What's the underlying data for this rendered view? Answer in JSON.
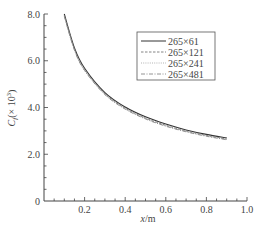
{
  "chart_data": {
    "type": "line",
    "title": "",
    "xlabel": "x/m",
    "ylabel": "Cf(×10³)",
    "ylabel_parts": {
      "main": "C",
      "sub": "f",
      "paren": "(× 10",
      "sup": "3",
      "close": ")"
    },
    "xlabel_parts": {
      "var": "x",
      "unit": "/m"
    },
    "xlim": [
      0,
      1.0
    ],
    "ylim": [
      0,
      8.0
    ],
    "x_ticks": [
      "0.2",
      "0.4",
      "0.6",
      "0.8",
      "1.0"
    ],
    "x_tick_values": [
      0.2,
      0.4,
      0.6,
      0.8,
      1.0
    ],
    "y_ticks": [
      "0",
      "2.0",
      "4.0",
      "6.0",
      "8.0"
    ],
    "y_tick_values": [
      0,
      2.0,
      4.0,
      6.0,
      8.0
    ],
    "grid": false,
    "legend_position": "upper right",
    "x": [
      0.1,
      0.15,
      0.2,
      0.3,
      0.4,
      0.5,
      0.6,
      0.7,
      0.8,
      0.9
    ],
    "series": [
      {
        "name": "265×61",
        "style": "solid",
        "color": "#333333",
        "values": [
          8.0,
          6.55,
          5.68,
          4.64,
          4.02,
          3.6,
          3.29,
          3.04,
          2.85,
          2.7
        ]
      },
      {
        "name": "265×121",
        "style": "dashed",
        "color": "#777777",
        "values": [
          7.95,
          6.5,
          5.63,
          4.59,
          3.97,
          3.55,
          3.24,
          3.0,
          2.81,
          2.65
        ]
      },
      {
        "name": "265×241",
        "style": "dotted",
        "color": "#999999",
        "values": [
          7.92,
          6.47,
          5.6,
          4.57,
          3.95,
          3.53,
          3.22,
          2.98,
          2.79,
          2.63
        ]
      },
      {
        "name": "265×481",
        "style": "dash-dot",
        "color": "#888888",
        "values": [
          7.9,
          6.45,
          5.58,
          4.55,
          3.93,
          3.51,
          3.2,
          2.96,
          2.77,
          2.62
        ]
      }
    ]
  },
  "legend": {
    "items": [
      "265×61",
      "265×121",
      "265×241",
      "265×481"
    ]
  }
}
